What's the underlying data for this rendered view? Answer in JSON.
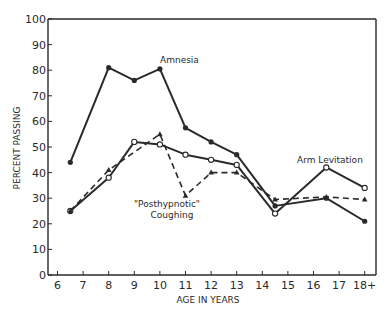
{
  "chart_data": {
    "type": "line",
    "title": "",
    "xlabel": "AGE IN YEARS",
    "ylabel": "PERCENT PASSING",
    "ylim": [
      0,
      100
    ],
    "yticks": [
      0,
      10,
      20,
      30,
      40,
      50,
      60,
      70,
      80,
      90,
      100
    ],
    "xticks": [
      "6",
      "7",
      "8",
      "9",
      "10",
      "11",
      "12",
      "13",
      "14",
      "15",
      "16",
      "17",
      "18+"
    ],
    "grid": false,
    "legend": "none (inline annotations)",
    "series": [
      {
        "name": "Amnesia",
        "style": "solid",
        "marker": "filled-circle",
        "x": [
          6.5,
          8,
          9,
          10,
          11,
          12,
          13,
          14.5,
          16.5,
          18
        ],
        "values": [
          44,
          81,
          76,
          80.5,
          57.5,
          52,
          47,
          27,
          30,
          21
        ]
      },
      {
        "name": "Arm Levitation",
        "style": "solid",
        "marker": "open-circle",
        "x": [
          6.5,
          8,
          9,
          10,
          11,
          12,
          13,
          14.5,
          16.5,
          18
        ],
        "values": [
          25,
          38,
          52,
          51,
          47,
          45,
          43,
          24,
          42,
          34
        ]
      },
      {
        "name": "\"Posthypnotic\" Coughing",
        "style": "dashed",
        "marker": "filled-triangle",
        "x": [
          6.5,
          8,
          10,
          11,
          12,
          13,
          14.5,
          16.5,
          18
        ],
        "values": [
          25,
          41,
          55,
          31,
          40,
          40,
          29.5,
          30.5,
          29.5
        ]
      }
    ],
    "annotations": [
      {
        "text": "Amnesia",
        "x": 10.2,
        "y": 83
      },
      {
        "text": "Arm Levitation",
        "x": 16.2,
        "y": 46
      },
      {
        "text": "\"Posthypnotic\"",
        "x": 11,
        "y": 29
      },
      {
        "text": "Coughing",
        "x": 11,
        "y": 25
      }
    ]
  },
  "labels": {
    "ylabel": "PERCENT PASSING",
    "xlabel": "AGE IN YEARS",
    "amnesia": "Amnesia",
    "arm": "Arm Levitation",
    "cough1": "\"Posthypnotic\"",
    "cough2": "Coughing"
  },
  "colors": {
    "ink": "#2a2a2a",
    "background": "#ffffff"
  }
}
